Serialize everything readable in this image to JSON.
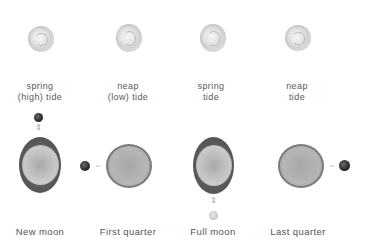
{
  "diagram": {
    "top_row": {
      "items": [
        {
          "icon": "sun-icon",
          "label_line1": "spring",
          "label_line2": "(high) tide"
        },
        {
          "icon": "sun-icon",
          "label_line1": "neap",
          "label_line2": "(low) tide"
        },
        {
          "icon": "sun-icon",
          "label_line1": "spring",
          "label_line2": "tide"
        },
        {
          "icon": "sun-icon",
          "label_line1": "neap",
          "label_line2": "tide"
        }
      ]
    },
    "bottom_row": {
      "phases": [
        {
          "label": "New moon",
          "moon_position": "above",
          "earth": "bulged-vertical"
        },
        {
          "label": "First quarter",
          "moon_position": "left",
          "earth": "round"
        },
        {
          "label": "Full moon",
          "moon_position": "below",
          "earth": "bulged-vertical"
        },
        {
          "label": "Last quarter",
          "moon_position": "right",
          "earth": "round"
        }
      ]
    },
    "arrows": {
      "vertical": "⇕",
      "horizontal": "⇔"
    },
    "colors": {
      "text": "#555555",
      "bulge": "#5a5a5a",
      "earth": "#bdbdbd",
      "moon_dark": "#222222",
      "arrow": "#9a9a9a"
    }
  }
}
